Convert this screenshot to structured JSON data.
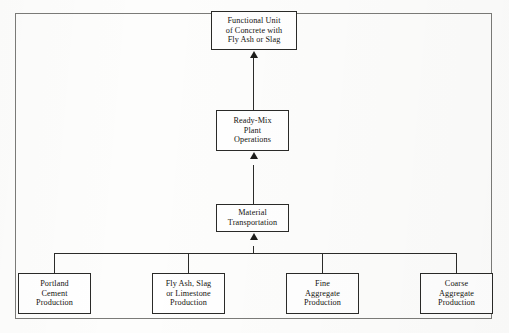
{
  "diagram": {
    "frame_label": "outer-border",
    "nodes": {
      "functional_unit": {
        "name": "functional-unit",
        "lines": [
          "Functional Unit",
          "of Concrete with",
          "Fly Ash or Slag"
        ]
      },
      "ready_mix": {
        "name": "ready-mix-plant-operations",
        "lines": [
          "Ready-Mix",
          "Plant",
          "Operations"
        ]
      },
      "transportation": {
        "name": "material-transportation",
        "lines": [
          "Material",
          "Transportation"
        ]
      },
      "portland_cement": {
        "name": "portland-cement-production",
        "lines": [
          "Portland",
          "Cement",
          "Production"
        ]
      },
      "fly_ash_slag": {
        "name": "fly-ash-slag-limestone-production",
        "lines": [
          "Fly Ash, Slag",
          "or Limestone",
          "Production"
        ]
      },
      "fine_aggregate": {
        "name": "fine-aggregate-production",
        "lines": [
          "Fine",
          "Aggregate",
          "Production"
        ]
      },
      "coarse_aggregate": {
        "name": "coarse-aggregate-production",
        "lines": [
          "Coarse",
          "Aggregate",
          "Production"
        ]
      }
    },
    "colors": {
      "box_border": "#2a2a28",
      "frame_border": "#7b7b78",
      "connector": "#2b2b29",
      "text": "#15140f",
      "background": "#fdfdfc"
    }
  }
}
